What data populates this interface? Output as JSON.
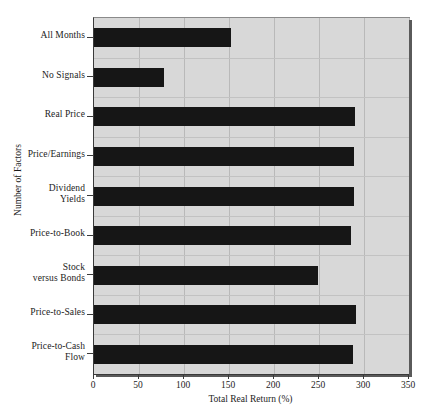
{
  "chart_data": {
    "type": "bar",
    "orientation": "horizontal",
    "title": "",
    "xlabel": "Total Real Return (%)",
    "ylabel": "Number of Factors",
    "xlim": [
      0,
      350
    ],
    "xticks": [
      0,
      50,
      100,
      150,
      200,
      250,
      300,
      350
    ],
    "xtick_labels": [
      "0",
      "50",
      "100",
      "150",
      "200",
      "250",
      "300",
      "350"
    ],
    "grid": true,
    "legend": null,
    "categories": [
      "All Months",
      "No Signals",
      "Real Price",
      "Price/Earnings",
      "Dividend\nYields",
      "Price-to-Book",
      "Stock\nversus Bonds",
      "Price-to-Sales",
      "Price-to-Cash\nFlow"
    ],
    "values": [
      152,
      78,
      290,
      289,
      289,
      285,
      249,
      291,
      288
    ],
    "bar_color": "#161616",
    "plot_background": "#d8d8d8",
    "grid_color": "#bdbdbd"
  }
}
